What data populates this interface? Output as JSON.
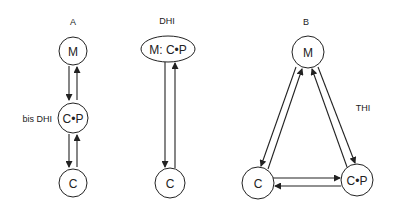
{
  "diagram": {
    "panels": [
      {
        "title": "A",
        "side_label": "bis DHI",
        "nodes": [
          "M",
          "C•P",
          "C"
        ]
      },
      {
        "title": "DHI",
        "nodes": [
          "M: C•P",
          "C"
        ]
      },
      {
        "title": "B",
        "side_label": "THI",
        "nodes": [
          "M",
          "C",
          "C•P"
        ]
      }
    ],
    "colors": {
      "stroke": "#222222",
      "background": "#ffffff"
    }
  }
}
